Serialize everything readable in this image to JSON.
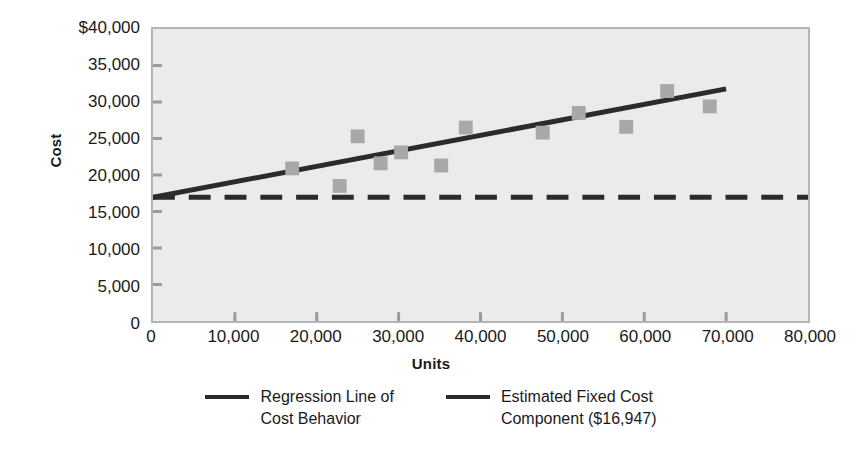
{
  "chart_data": {
    "type": "scatter",
    "title": "",
    "xlabel": "Units",
    "ylabel": "Cost",
    "xlim": [
      0,
      80000
    ],
    "ylim": [
      0,
      40000
    ],
    "grid": false,
    "legend_position": "bottom",
    "x_ticks": [
      "0",
      "10,000",
      "20,000",
      "30,000",
      "40,000",
      "50,000",
      "60,000",
      "70,000",
      "80,000"
    ],
    "x_tick_values": [
      0,
      10000,
      20000,
      30000,
      40000,
      50000,
      60000,
      70000,
      80000
    ],
    "y_ticks": [
      "0",
      "5,000",
      "10,000",
      "15,000",
      "20,000",
      "25,000",
      "30,000",
      "35,000",
      "$40,000"
    ],
    "y_tick_values": [
      0,
      5000,
      10000,
      15000,
      20000,
      25000,
      30000,
      35000,
      40000
    ],
    "series": [
      {
        "name": "Observed Cost Points",
        "type": "scatter",
        "marker": "square",
        "color": "#a8a8a8",
        "points": [
          {
            "x": 17000,
            "y": 20900
          },
          {
            "x": 22800,
            "y": 18500
          },
          {
            "x": 25000,
            "y": 25300
          },
          {
            "x": 27800,
            "y": 21600
          },
          {
            "x": 30300,
            "y": 23100
          },
          {
            "x": 35200,
            "y": 21300
          },
          {
            "x": 38200,
            "y": 26500
          },
          {
            "x": 47600,
            "y": 25800
          },
          {
            "x": 52000,
            "y": 28500
          },
          {
            "x": 57800,
            "y": 26600
          },
          {
            "x": 62800,
            "y": 31500
          },
          {
            "x": 68000,
            "y": 29400
          }
        ]
      },
      {
        "name": "Regression Line of Cost Behavior",
        "type": "line",
        "style": "solid",
        "color": "#2b2b2b",
        "intercept": 16947,
        "slope": 0.2122,
        "x_start": 0,
        "x_end": 70000,
        "y_start": 16947,
        "y_end": 31800
      },
      {
        "name": "Estimated Fixed Cost Component ($16,947)",
        "type": "line",
        "style": "dashed",
        "color": "#2b2b2b",
        "value": 16947,
        "x_start": 0,
        "x_end": 80000,
        "y_start": 16947,
        "y_end": 16947
      }
    ]
  },
  "axes": {
    "y_title": "Cost",
    "x_title": "Units",
    "y_labels": [
      "$40,000",
      "35,000",
      "30,000",
      "25,000",
      "20,000",
      "15,000",
      "10,000",
      "5,000",
      "0"
    ],
    "x_labels": [
      "0",
      "10,000",
      "20,000",
      "30,000",
      "40,000",
      "50,000",
      "60,000",
      "70,000",
      "80,000"
    ],
    "x_origin_label": "0"
  },
  "legend": {
    "items": [
      {
        "label": "Regression Line of\nCost Behavior",
        "style": "solid",
        "color": "#2b2b2b"
      },
      {
        "label": "Estimated Fixed Cost\nComponent ($16,947)",
        "style": "dashed",
        "color": "#2b2b2b"
      }
    ]
  },
  "colors": {
    "plot_background": "#ebebeb",
    "plot_border": "#b4b4b4",
    "line": "#2b2b2b",
    "marker": "#a8a8a8",
    "text": "#1a1a1a"
  }
}
